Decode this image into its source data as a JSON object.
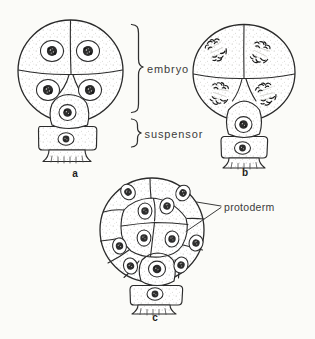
{
  "palette": {
    "paper": "#fbfbf8",
    "ink": "#2b2b2b",
    "label_text": "#3c3c3c",
    "stipple_dot": "#b3b1ab"
  },
  "labels": {
    "embryo": "embryo",
    "suspensor": "suspensor",
    "protoderm": "protoderm"
  },
  "panels": {
    "a": "a",
    "b": "b",
    "c": "c"
  }
}
